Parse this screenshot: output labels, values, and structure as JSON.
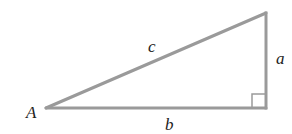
{
  "diagram": {
    "type": "right-triangle",
    "line_color": "#9a9a9a",
    "vertices": {
      "A": {
        "x": 46,
        "y": 108
      },
      "top": {
        "x": 266,
        "y": 13
      },
      "right_angle": {
        "x": 266,
        "y": 108
      }
    },
    "labels": {
      "vertex_A": "A",
      "hypotenuse": "c",
      "vertical_leg": "a",
      "horizontal_leg": "b"
    },
    "right_angle_marker": true
  }
}
